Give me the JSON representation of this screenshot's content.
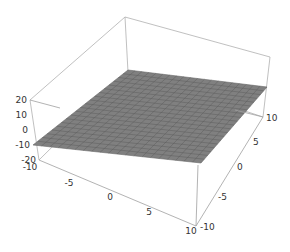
{
  "chart_data": {
    "type": "surface3d",
    "title": "",
    "x": {
      "label": "",
      "range": [
        -10,
        10
      ],
      "ticks": [
        "-10",
        "-5",
        "0",
        "5",
        "10"
      ]
    },
    "y": {
      "label": "",
      "range": [
        -10,
        10
      ],
      "ticks": [
        "-10",
        "-5",
        "0",
        "5",
        "10"
      ]
    },
    "z": {
      "label": "",
      "range": [
        -20,
        20
      ],
      "ticks": [
        "20",
        "10",
        "0",
        "-10",
        "-20"
      ]
    },
    "surface": {
      "z_value": 0,
      "mesh_divisions": 20,
      "color": "#7f7f7f",
      "mesh_color": "#555555"
    },
    "box_color": "#aaaaaa"
  },
  "labels": {
    "z_ticks": [
      "20",
      "10",
      "0",
      "-10",
      "-20"
    ],
    "x_ticks": [
      "-10",
      "-5",
      "0",
      "5",
      "10"
    ],
    "y_ticks": [
      "-10",
      "-5",
      "0",
      "5",
      "10"
    ]
  }
}
